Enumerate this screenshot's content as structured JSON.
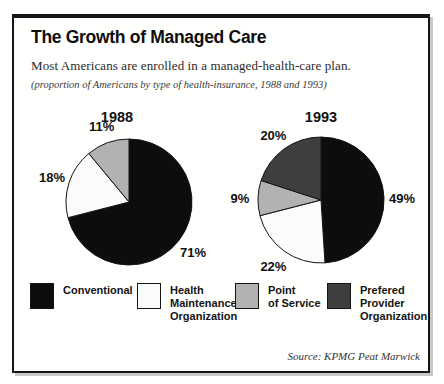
{
  "header": {
    "title": "The Growth of Managed Care",
    "subtitle": "Most Americans are enrolled in a managed-health-care plan.",
    "note": "(proportion of Americans by type of health-insurance, 1988 and 1993)"
  },
  "chart_data": [
    {
      "type": "pie",
      "title": "1988",
      "unit": "%",
      "start_angle_deg": 0,
      "direction": "clockwise",
      "slices": [
        {
          "label": "Conventional",
          "value": 71,
          "color": "#0d0d0d"
        },
        {
          "label": "Health Maintenance Organization",
          "value": 18,
          "color": "#fbfbf9"
        },
        {
          "label": "Point of Service",
          "value": 11,
          "color": "#b0b3b0"
        }
      ]
    },
    {
      "type": "pie",
      "title": "1993",
      "unit": "%",
      "start_angle_deg": 0,
      "direction": "clockwise",
      "slices": [
        {
          "label": "Conventional",
          "value": 49,
          "color": "#0d0d0d"
        },
        {
          "label": "Health Maintenance Organization",
          "value": 22,
          "color": "#fbfbf9"
        },
        {
          "label": "Point of Service",
          "value": 9,
          "color": "#b0b3b0"
        },
        {
          "label": "Prefered Provider Organization",
          "value": 20,
          "color": "#3e3e3e"
        }
      ]
    }
  ],
  "legend": {
    "items": [
      {
        "label": "Conventional",
        "color": "#0d0d0d"
      },
      {
        "label": "Health\nMaintenance\nOrganization",
        "color": "#fbfbf9"
      },
      {
        "label": "Point\nof Service",
        "color": "#b0b3b0"
      },
      {
        "label": "Prefered\nProvider\nOrganization",
        "color": "#3e3e3e"
      }
    ]
  },
  "footer": {
    "source": "Source: KPMG Peat Marwick"
  }
}
